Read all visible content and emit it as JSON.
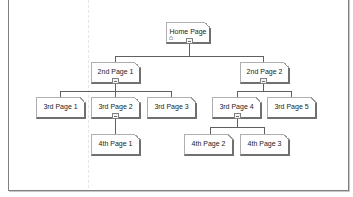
{
  "sitemap": {
    "root": {
      "label": "Home Page",
      "icon": "home-icon"
    },
    "level2": [
      {
        "label": "2nd Page 1"
      },
      {
        "label": "2nd Page 2"
      }
    ],
    "level3": [
      {
        "label": "3rd Page 1",
        "parent": "2nd Page 1"
      },
      {
        "label": "3rd Page 2",
        "parent": "2nd Page 1"
      },
      {
        "label": "3rd Page 3",
        "parent": "2nd Page 1"
      },
      {
        "label": "3rd Page 4",
        "parent": "2nd Page 2"
      },
      {
        "label": "3rd Page 5",
        "parent": "2nd Page 2"
      }
    ],
    "level4": [
      {
        "label": "4th Page 1",
        "parent": "3rd Page 2"
      },
      {
        "label": "4th Page 2",
        "parent": "3rd Page 4"
      },
      {
        "label": "4th Page 3",
        "parent": "3rd Page 4"
      }
    ]
  }
}
